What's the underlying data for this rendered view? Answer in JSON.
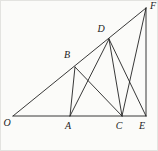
{
  "figure": {
    "background_color": "#fbfbf9",
    "stroke_color": "#222222",
    "stroke_width": 0.9,
    "label_color": "#1c1c1c",
    "canvas": {
      "width": 158,
      "height": 151
    },
    "points": {
      "O": {
        "x": 12,
        "y": 115
      },
      "A": {
        "x": 69,
        "y": 115
      },
      "C": {
        "x": 121,
        "y": 115
      },
      "E": {
        "x": 145,
        "y": 115
      },
      "B": {
        "x": 74,
        "y": 66
      },
      "D": {
        "x": 108,
        "y": 38
      },
      "F": {
        "x": 145,
        "y": 7
      }
    },
    "segments": [
      [
        "O",
        "E"
      ],
      [
        "O",
        "F"
      ],
      [
        "E",
        "F"
      ],
      [
        "A",
        "B"
      ],
      [
        "A",
        "D"
      ],
      [
        "B",
        "C"
      ],
      [
        "C",
        "D"
      ],
      [
        "C",
        "F"
      ],
      [
        "D",
        "E"
      ]
    ],
    "labels": [
      {
        "text": "O",
        "x": 6,
        "y": 123
      },
      {
        "text": "A",
        "x": 67,
        "y": 126
      },
      {
        "text": "C",
        "x": 118,
        "y": 126
      },
      {
        "text": "E",
        "x": 141,
        "y": 126
      },
      {
        "text": "B",
        "x": 66,
        "y": 55
      },
      {
        "text": "D",
        "x": 100,
        "y": 29
      },
      {
        "text": "F",
        "x": 152,
        "y": 6
      }
    ]
  }
}
